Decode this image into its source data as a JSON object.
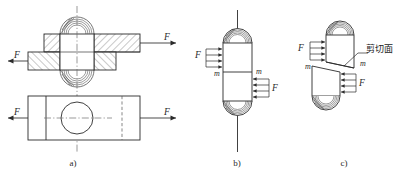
{
  "figure": {
    "panels": [
      {
        "key": "a",
        "caption": "a)",
        "description": "Sectioned assembly of two lapped plates joined by a rivet, with plan view below",
        "force_labels": [
          "F",
          "F",
          "F",
          "F"
        ]
      },
      {
        "key": "b",
        "caption": "b)",
        "description": "Free body of the rivet showing bearing force distributions",
        "force_labels": [
          "F",
          "F"
        ],
        "moment_labels": [
          "m",
          "m"
        ]
      },
      {
        "key": "c",
        "caption": "c)",
        "description": "Rivet sheared along the shear plane between the two plates",
        "force_labels": [
          "F",
          "F"
        ],
        "moment_labels": [
          "m",
          "m"
        ],
        "annotation": "剪切面"
      }
    ],
    "symbols": {
      "force": "F",
      "distributed": "m",
      "shear_plane_cn": "剪切面"
    },
    "colors": {
      "line": "#2b2b2b",
      "hatch": "#4a4a4a",
      "center_line": "#6f6f6f",
      "background": "#ffffff"
    }
  }
}
